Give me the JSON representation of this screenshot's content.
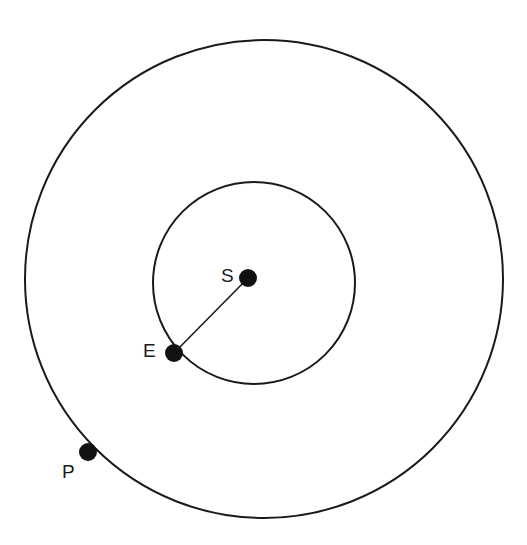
{
  "diagram": {
    "colors": {
      "stroke": "#1a1a1a",
      "dot": "#111111",
      "background": "#ffffff"
    },
    "orbits": [
      {
        "name": "outer-orbit",
        "cx": 264,
        "cy": 279,
        "r": 239
      },
      {
        "name": "inner-orbit",
        "cx": 254,
        "cy": 283,
        "r": 101
      }
    ],
    "bodies": [
      {
        "id": "sun",
        "label": "S",
        "cx": 248,
        "cy": 278,
        "r": 9
      },
      {
        "id": "earth",
        "label": "E",
        "cx": 174,
        "cy": 353,
        "r": 9
      },
      {
        "id": "planet",
        "label": "P",
        "cx": 88,
        "cy": 452,
        "r": 9
      }
    ],
    "connectors": [
      {
        "from": "S",
        "to": "E"
      }
    ]
  }
}
